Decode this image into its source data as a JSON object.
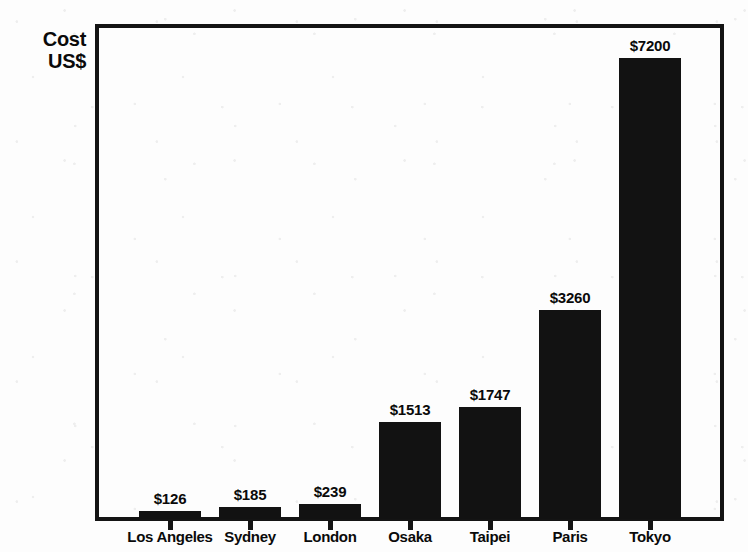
{
  "chart_data": {
    "type": "bar",
    "title": "",
    "subtitle": "",
    "xlabel": "",
    "ylabel": "Cost US$",
    "ylabel_lines": [
      "Cost",
      "US$"
    ],
    "categories": [
      "Los Angeles",
      "Sydney",
      "London",
      "Osaka",
      "Taipei",
      "Paris",
      "Tokyo"
    ],
    "values": [
      126,
      185,
      239,
      1513,
      1747,
      3260,
      7200
    ],
    "value_labels": [
      "$126",
      "$185",
      "$239",
      "$1513",
      "$1747",
      "$3260",
      "$7200"
    ],
    "ylim": [
      0,
      7200
    ],
    "grid": false,
    "legend": null,
    "bar_color": "#121212",
    "frame_color": "#141414",
    "background_color": "#fdfdfd",
    "axis_tick_labels_y": [],
    "currency": "US$"
  },
  "axis": {
    "y_title_line1": "Cost",
    "y_title_line2": "US$"
  }
}
